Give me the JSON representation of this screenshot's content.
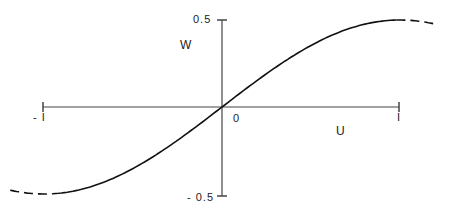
{
  "chart_data": {
    "type": "line",
    "title": "",
    "xlabel": "U",
    "ylabel": "W",
    "xlim": [
      -1.1,
      1.1
    ],
    "ylim": [
      -0.5,
      0.5
    ],
    "x_ticks": [
      "-1",
      "0",
      "1"
    ],
    "y_ticks": [
      "0.5",
      "-0.5"
    ],
    "grid": false,
    "legend": null,
    "series": [
      {
        "name": "W(U)",
        "style": "solid within [-1,1], dashed beyond",
        "x": [
          -1.2,
          -1.0,
          -0.8,
          -0.6,
          -0.4,
          -0.2,
          0.0,
          0.2,
          0.4,
          0.6,
          0.8,
          1.0,
          1.2
        ],
        "y": [
          -0.45,
          -0.5,
          -0.48,
          -0.4,
          -0.29,
          -0.15,
          0.0,
          0.15,
          0.29,
          0.4,
          0.48,
          0.5,
          0.45
        ]
      }
    ]
  },
  "labels": {
    "y_top": "0.5",
    "y_bottom": "- 0.5",
    "x_left": "- I",
    "x_right": "I",
    "origin": "0",
    "x_axis": "U",
    "y_axis": "W"
  }
}
